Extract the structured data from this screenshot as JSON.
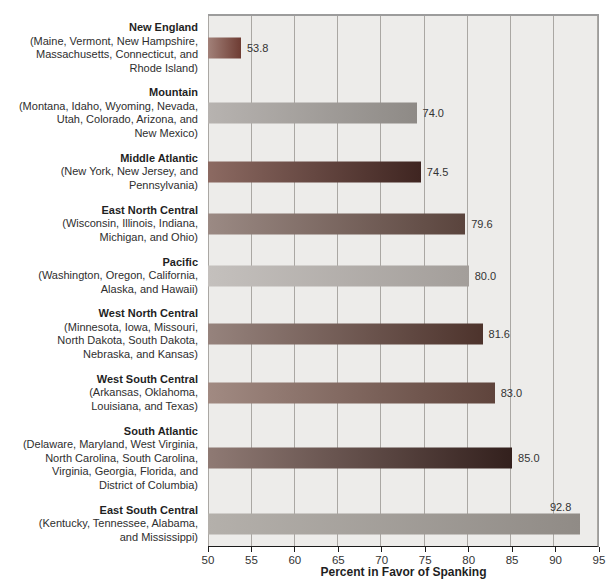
{
  "figure": {
    "xlabel": "Percent in Favor of Spanking"
  },
  "colors": {
    "plot_background": "#edecea",
    "gridline": "#aaa7a3",
    "plot_border": "#9c9c9c",
    "axis_line": "#1c1c1c",
    "label_text": "#2e2e2e",
    "value_text": "#333333"
  },
  "chart_data": {
    "type": "bar",
    "orientation": "horizontal",
    "xlabel": "Percent in Favor of Spanking",
    "xlim": [
      50,
      95
    ],
    "x_ticks": [
      "50",
      "55",
      "60",
      "65",
      "70",
      "75",
      "80",
      "85",
      "90",
      "95"
    ],
    "grid": true,
    "legend": "none",
    "categories": [
      "New England",
      "Mountain",
      "Middle Atlantic",
      "East North Central",
      "Pacific",
      "West North Central",
      "West South Central",
      "South Atlantic",
      "East South Central"
    ],
    "values": [
      53.8,
      74.0,
      74.5,
      79.6,
      80.0,
      81.6,
      83.0,
      85.0,
      92.8
    ],
    "regions": [
      {
        "name": "New England",
        "states_lines": [
          "(Maine, Vermont, New Hampshire,",
          "Massachusetts, Connecticut, and",
          "Rhode Island)"
        ],
        "value": 53.8,
        "value_label": "53.8",
        "value_label_position": "right",
        "bar_color_left": "#a28179",
        "bar_color_right": "#6e3c33"
      },
      {
        "name": "Mountain",
        "states_lines": [
          "(Montana, Idaho, Wyoming, Nevada,",
          "Utah, Colorado, Arizona, and",
          "New Mexico)"
        ],
        "value": 74.0,
        "value_label": "74.0",
        "value_label_position": "right",
        "bar_color_left": "#b7b3b0",
        "bar_color_right": "#8e8a86"
      },
      {
        "name": "Middle Atlantic",
        "states_lines": [
          "(New York, New Jersey, and",
          "Pennsylvania)"
        ],
        "value": 74.5,
        "value_label": "74.5",
        "value_label_position": "right",
        "bar_color_left": "#8c6a62",
        "bar_color_right": "#3f2521"
      },
      {
        "name": "East North Central",
        "states_lines": [
          "(Wisconsin, Illinois, Indiana,",
          "Michigan, and Ohio)"
        ],
        "value": 79.6,
        "value_label": "79.6",
        "value_label_position": "right",
        "bar_color_left": "#9b8a84",
        "bar_color_right": "#5a443d"
      },
      {
        "name": "Pacific",
        "states_lines": [
          "(Washington, Oregon, California,",
          "Alaska, and Hawaii)"
        ],
        "value": 80.0,
        "value_label": "80.0",
        "value_label_position": "right",
        "bar_color_left": "#c4c0bd",
        "bar_color_right": "#a39e9a"
      },
      {
        "name": "West North Central",
        "states_lines": [
          "(Minnesota, Iowa, Missouri,",
          "North Dakota, South Dakota,",
          "Nebraska, and Kansas)"
        ],
        "value": 81.6,
        "value_label": "81.6",
        "value_label_position": "right",
        "bar_color_left": "#96837d",
        "bar_color_right": "#4d332c"
      },
      {
        "name": "West South Central",
        "states_lines": [
          "(Arkansas, Oklahoma,",
          "Louisiana, and Texas)"
        ],
        "value": 83.0,
        "value_label": "83.0",
        "value_label_position": "right",
        "bar_color_left": "#a18a82",
        "bar_color_right": "#5f443c"
      },
      {
        "name": "South Atlantic",
        "states_lines": [
          "(Delaware, Maryland, West Virginia,",
          "North Carolina, South Carolina,",
          "Virginia, Georgia, Florida, and",
          "District of Columbia)"
        ],
        "value": 85.0,
        "value_label": "85.0",
        "value_label_position": "right",
        "bar_color_left": "#8f7a74",
        "bar_color_right": "#33201d"
      },
      {
        "name": "East South Central",
        "states_lines": [
          "(Kentucky, Tennessee, Alabama,",
          "and Mississippi)"
        ],
        "value": 92.8,
        "value_label": "92.8",
        "value_label_position": "above",
        "bar_color_left": "#b4b0ab",
        "bar_color_right": "#908b86"
      }
    ]
  }
}
